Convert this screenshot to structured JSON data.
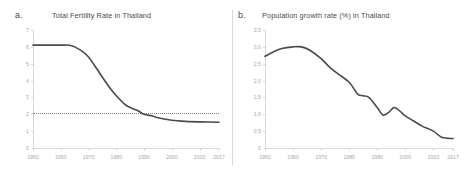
{
  "figure": {
    "divider_color": "#d9d9d9",
    "background": "#ffffff"
  },
  "panels": [
    {
      "letter": "a.",
      "title": "Total Fertility Rate in Thailand"
    },
    {
      "letter": "b.",
      "title": "Population growth rate (%) in Thailand"
    }
  ],
  "chart_data": [
    {
      "type": "line",
      "title": "Total Fertility Rate in Thailand",
      "panel": "a.",
      "xlabel": "",
      "ylabel": "",
      "xlim": [
        1950,
        2017
      ],
      "ylim": [
        0,
        7
      ],
      "ytick_labels": [
        "7",
        "6",
        "5",
        "4",
        "3",
        "2",
        "1",
        "0"
      ],
      "ytick_values": [
        7,
        6,
        5,
        4,
        3,
        2,
        1,
        0
      ],
      "xtick_labels": [
        "1950",
        "1960",
        "1970",
        "1980",
        "1990",
        "2000",
        "2010",
        "2017"
      ],
      "xtick_values": [
        1950,
        1960,
        1970,
        1980,
        1990,
        2000,
        2010,
        2017
      ],
      "grid": false,
      "legend": "none",
      "line_color": "#4a4a4a",
      "annotations": [
        {
          "kind": "horizontal-reference-line",
          "label": "replacement level",
          "value": 2.1,
          "style": "dotted",
          "color": "#7f7f7f"
        }
      ],
      "x": [
        1950,
        1955,
        1960,
        1963,
        1965,
        1968,
        1970,
        1973,
        1975,
        1978,
        1980,
        1983,
        1985,
        1988,
        1990,
        1993,
        1995,
        2000,
        2005,
        2010,
        2017
      ],
      "values": [
        6.1,
        6.1,
        6.1,
        6.1,
        6.0,
        5.7,
        5.4,
        4.7,
        4.2,
        3.5,
        3.1,
        2.6,
        2.4,
        2.2,
        2.0,
        1.9,
        1.8,
        1.65,
        1.58,
        1.55,
        1.53
      ]
    },
    {
      "type": "line",
      "title": "Population growth rate (%) in Thailand",
      "panel": "b.",
      "xlabel": "",
      "ylabel": "",
      "xlim": [
        1950,
        2017
      ],
      "ylim": [
        0,
        3.5
      ],
      "ytick_labels": [
        "3.5",
        "3.0",
        "2.5",
        "2.0",
        "1.5",
        "1.0",
        "0.5",
        "0"
      ],
      "ytick_values": [
        3.5,
        3.0,
        2.5,
        2.0,
        1.5,
        1.0,
        0.5,
        0
      ],
      "xtick_labels": [
        "1950",
        "1960",
        "1970",
        "1980",
        "1990",
        "2000",
        "2010",
        "2017"
      ],
      "xtick_values": [
        1950,
        1960,
        1970,
        1980,
        1990,
        2000,
        2010,
        2017
      ],
      "grid": false,
      "legend": "none",
      "line_color": "#4a4a4a",
      "annotations": [],
      "x": [
        1950,
        1953,
        1956,
        1960,
        1963,
        1966,
        1970,
        1973,
        1976,
        1980,
        1983,
        1985,
        1987,
        1990,
        1992,
        1994,
        1996,
        1998,
        2000,
        2003,
        2006,
        2010,
        2013,
        2017
      ],
      "values": [
        2.72,
        2.85,
        2.95,
        3.0,
        3.0,
        2.9,
        2.65,
        2.4,
        2.2,
        1.95,
        1.6,
        1.55,
        1.5,
        1.2,
        0.98,
        1.05,
        1.2,
        1.1,
        0.95,
        0.8,
        0.65,
        0.5,
        0.32,
        0.28
      ]
    }
  ]
}
